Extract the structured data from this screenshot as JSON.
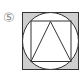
{
  "figure": {
    "label": "⑤",
    "colors": {
      "shade": "#cfcfcf",
      "stroke": "#333333",
      "label": "#888888"
    }
  }
}
